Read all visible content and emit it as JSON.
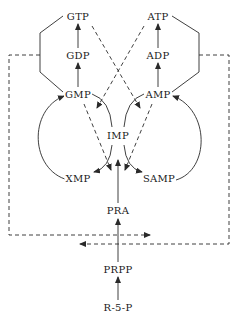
{
  "diagram": {
    "type": "purine nucleotide biosynthesis feedback regulation pathway",
    "colors": {
      "background": "#ffffff",
      "line": "#2a2a2a",
      "text": "#1a1a1a"
    },
    "nodes": {
      "gtp": "GTP",
      "atp": "ATP",
      "gdp": "GDP",
      "adp": "ADP",
      "gmp": "GMP",
      "amp": "AMP",
      "imp": "IMP",
      "xmp": "XMP",
      "samp": "SAMP",
      "pra": "PRA",
      "prpp": "PRPP",
      "r5p": "R-5-P"
    },
    "edges": [
      {
        "from": "R-5-P",
        "to": "PRPP",
        "style": "solid"
      },
      {
        "from": "PRPP",
        "to": "PRA",
        "style": "solid"
      },
      {
        "from": "PRA",
        "to": "IMP",
        "style": "solid"
      },
      {
        "from": "IMP",
        "to": "XMP",
        "style": "solid-curved"
      },
      {
        "from": "XMP",
        "to": "GMP",
        "style": "solid-curved"
      },
      {
        "from": "IMP",
        "to": "SAMP",
        "style": "solid-curved"
      },
      {
        "from": "SAMP",
        "to": "AMP",
        "style": "solid-curved"
      },
      {
        "from": "GMP",
        "to": "IMP",
        "style": "solid-curved"
      },
      {
        "from": "AMP",
        "to": "IMP",
        "style": "solid-curved"
      },
      {
        "from": "GMP",
        "to": "GDP",
        "style": "solid"
      },
      {
        "from": "GDP",
        "to": "GTP",
        "style": "solid"
      },
      {
        "from": "AMP",
        "to": "ADP",
        "style": "solid"
      },
      {
        "from": "ADP",
        "to": "ATP",
        "style": "solid"
      },
      {
        "from": "GTP",
        "to": "AMP-synthesis",
        "style": "dashed"
      },
      {
        "from": "ATP",
        "to": "GMP-synthesis",
        "style": "dashed"
      },
      {
        "from": "GMP",
        "to": "IMP-to-XMP",
        "style": "dashed"
      },
      {
        "from": "AMP",
        "to": "IMP-to-SAMP",
        "style": "dashed"
      },
      {
        "from": "guanine-nucleotides",
        "to": "PRPP-to-PRA",
        "style": "dashed"
      },
      {
        "from": "adenine-nucleotides",
        "to": "PRPP-to-PRA",
        "style": "dashed"
      }
    ]
  }
}
